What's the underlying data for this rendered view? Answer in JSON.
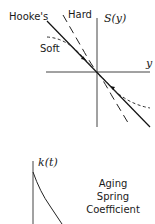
{
  "top_diagram": {
    "y_axis_label": "S(y)",
    "x_axis_label": "y",
    "labels": {
      "hookes": "Hooke's",
      "hard": "Hard",
      "soft": "Soft"
    },
    "colors": {
      "ink": "#1a1a1a",
      "background": "#ffffff"
    }
  },
  "bottom_diagram": {
    "y_axis_label": "k(t)",
    "caption_lines": [
      "Aging",
      "Spring",
      "Coefficient"
    ]
  }
}
